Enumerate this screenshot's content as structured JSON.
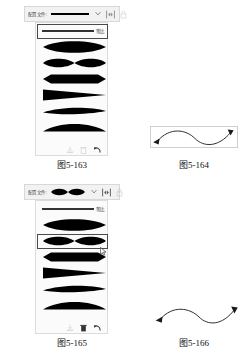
{
  "document": {
    "type": "textbook-figure-plate",
    "language": "zh-CN"
  },
  "figures": [
    {
      "id": "fig-5-163",
      "caption": "图5-163",
      "kind": "profile-dropdown-panel",
      "toolbar": {
        "label": "配置文件:",
        "preview_shape": "uniform-line",
        "chevron": "chevron-down-icon",
        "flip_icon": "flip-horizontal-icon",
        "lock_icon": "lock-icon"
      },
      "list": {
        "selected_index": 0,
        "rows": [
          {
            "shape": "uniform-line",
            "tag": "等比"
          },
          {
            "shape": "width-profile-1",
            "tag": ""
          },
          {
            "shape": "width-profile-2",
            "tag": ""
          },
          {
            "shape": "width-profile-3",
            "tag": ""
          },
          {
            "shape": "width-profile-4",
            "tag": ""
          },
          {
            "shape": "width-profile-5",
            "tag": ""
          },
          {
            "shape": "width-profile-6",
            "tag": ""
          }
        ]
      },
      "footer_icons": [
        "add-profile-icon",
        "delete-profile-icon",
        "reset-profiles-icon"
      ]
    },
    {
      "id": "fig-5-164",
      "caption": "图5-164",
      "kind": "stroke-preview",
      "stroke": {
        "shape": "s-curve",
        "profile": "uniform-line",
        "start_arrow": "arrowhead",
        "end_arrow": "arrowhead",
        "bounding_box": true
      }
    },
    {
      "id": "fig-5-165",
      "caption": "图5-165",
      "kind": "profile-dropdown-panel",
      "toolbar": {
        "label": "配置文件:",
        "preview_shape": "width-profile-2",
        "chevron": "chevron-down-icon",
        "flip_icon": "flip-horizontal-icon",
        "lock_icon": "lock-icon"
      },
      "list": {
        "selected_index": 2,
        "rows": [
          {
            "shape": "uniform-line",
            "tag": "等比"
          },
          {
            "shape": "width-profile-1",
            "tag": ""
          },
          {
            "shape": "width-profile-2",
            "tag": ""
          },
          {
            "shape": "width-profile-3",
            "tag": ""
          },
          {
            "shape": "width-profile-4",
            "tag": ""
          },
          {
            "shape": "width-profile-5",
            "tag": ""
          },
          {
            "shape": "width-profile-6",
            "tag": ""
          }
        ]
      },
      "footer_icons": [
        "add-profile-icon",
        "delete-profile-icon",
        "reset-profiles-icon"
      ],
      "mouse_cursor": {
        "visible": true,
        "on_row_index": 2
      }
    },
    {
      "id": "fig-5-166",
      "caption": "图5-166",
      "kind": "stroke-preview",
      "stroke": {
        "shape": "s-curve",
        "profile": "width-profile-2",
        "start_arrow": "arrowhead",
        "end_arrow": "arrowhead",
        "bounding_box": false
      }
    }
  ],
  "colors": {
    "panel_bg": "#fbfbfb",
    "toolbar_bg": "#f2f2f2",
    "border": "#dcdcdc",
    "selection_border": "#4a4a4a",
    "ink": "#000000",
    "caption": "#111111"
  }
}
